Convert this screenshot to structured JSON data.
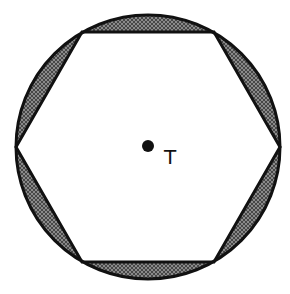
{
  "diagram": {
    "circle": {
      "cx": 148,
      "cy": 147,
      "r": 132
    },
    "hexagon": {
      "vertices": [
        [
          16,
          147
        ],
        [
          82,
          32
        ],
        [
          214,
          32
        ],
        [
          280,
          147
        ],
        [
          214,
          262
        ],
        [
          82,
          262
        ]
      ]
    },
    "center_point": {
      "cx": 148,
      "cy": 146,
      "r": 6,
      "label": "T"
    },
    "colors": {
      "stroke": "#111111",
      "shade": "#7a7a7a",
      "hatch": "#3a3a3a",
      "background": "#ffffff"
    }
  }
}
